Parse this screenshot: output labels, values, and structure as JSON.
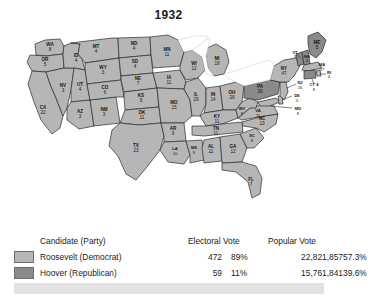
{
  "title": "1932",
  "colors": {
    "democrat_fill": "#b6b6b6",
    "republican_fill": "#8a8a8a",
    "border": "#2b2b2b",
    "band": "#e3e3e4"
  },
  "table": {
    "headers": {
      "candidate": "Candidate (Party)",
      "electoral": "Electoral Vote",
      "popular": "Popular Vote"
    },
    "rows": [
      {
        "candidate": "Roosevelt (Democrat)",
        "electoral_vote": "472",
        "electoral_pct": "89%",
        "popular_vote": "22,821,857",
        "popular_pct": "57.3%",
        "party": "dem"
      },
      {
        "candidate": "Hoover (Republican)",
        "electoral_vote": "59",
        "electoral_pct": "11%",
        "popular_vote": "15,761,841",
        "popular_pct": "39.6%",
        "party": "rep"
      }
    ]
  },
  "map": {
    "states": [
      {
        "code": "WA",
        "votes": "8",
        "party": "dem"
      },
      {
        "code": "OR",
        "votes": "5",
        "party": "dem"
      },
      {
        "code": "CA",
        "votes": "22",
        "party": "dem"
      },
      {
        "code": "NV",
        "votes": "3",
        "party": "dem"
      },
      {
        "code": "ID",
        "votes": "4",
        "party": "dem"
      },
      {
        "code": "MT",
        "votes": "4",
        "party": "dem"
      },
      {
        "code": "WY",
        "votes": "3",
        "party": "dem"
      },
      {
        "code": "UT",
        "votes": "4",
        "party": "dem"
      },
      {
        "code": "AZ",
        "votes": "3",
        "party": "dem"
      },
      {
        "code": "NM",
        "votes": "3",
        "party": "dem"
      },
      {
        "code": "CO",
        "votes": "6",
        "party": "dem"
      },
      {
        "code": "ND",
        "votes": "4",
        "party": "dem"
      },
      {
        "code": "SD",
        "votes": "4",
        "party": "dem"
      },
      {
        "code": "NE",
        "votes": "7",
        "party": "dem"
      },
      {
        "code": "KS",
        "votes": "9",
        "party": "dem"
      },
      {
        "code": "OK",
        "votes": "11",
        "party": "dem"
      },
      {
        "code": "TX",
        "votes": "23",
        "party": "dem"
      },
      {
        "code": "MN",
        "votes": "11",
        "party": "dem"
      },
      {
        "code": "IA",
        "votes": "11",
        "party": "dem"
      },
      {
        "code": "MO",
        "votes": "15",
        "party": "dem"
      },
      {
        "code": "AR",
        "votes": "9",
        "party": "dem"
      },
      {
        "code": "LA",
        "votes": "10",
        "party": "dem"
      },
      {
        "code": "MS",
        "votes": "9",
        "party": "dem"
      },
      {
        "code": "WI",
        "votes": "12",
        "party": "dem"
      },
      {
        "code": "IL",
        "votes": "29",
        "party": "dem"
      },
      {
        "code": "MI",
        "votes": "19",
        "party": "dem"
      },
      {
        "code": "IN",
        "votes": "14",
        "party": "dem"
      },
      {
        "code": "OH",
        "votes": "26",
        "party": "dem"
      },
      {
        "code": "KY",
        "votes": "11",
        "party": "dem"
      },
      {
        "code": "TN",
        "votes": "11",
        "party": "dem"
      },
      {
        "code": "AL",
        "votes": "11",
        "party": "dem"
      },
      {
        "code": "GA",
        "votes": "12",
        "party": "dem"
      },
      {
        "code": "FL",
        "votes": "7",
        "party": "dem"
      },
      {
        "code": "SC",
        "votes": "8",
        "party": "dem"
      },
      {
        "code": "NC",
        "votes": "13",
        "party": "dem"
      },
      {
        "code": "VA",
        "votes": "11",
        "party": "dem"
      },
      {
        "code": "WV",
        "votes": "8",
        "party": "dem"
      },
      {
        "code": "MD",
        "votes": "8",
        "party": "dem"
      },
      {
        "code": "DE",
        "votes": "3",
        "party": "dem"
      },
      {
        "code": "PA",
        "votes": "36",
        "party": "rep"
      },
      {
        "code": "NJ",
        "votes": "16",
        "party": "dem"
      },
      {
        "code": "NY",
        "votes": "47",
        "party": "dem"
      },
      {
        "code": "CT",
        "votes": "8",
        "party": "rep"
      },
      {
        "code": "RI",
        "votes": "4",
        "party": "dem"
      },
      {
        "code": "MA",
        "votes": "17",
        "party": "dem"
      },
      {
        "code": "VT",
        "votes": "3",
        "party": "rep"
      },
      {
        "code": "NH",
        "votes": "4",
        "party": "rep"
      },
      {
        "code": "ME",
        "votes": "5",
        "party": "rep"
      }
    ]
  }
}
